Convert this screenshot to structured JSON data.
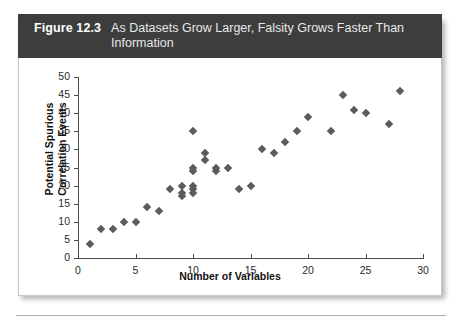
{
  "figure": {
    "label": "Figure 12.3",
    "caption": "As Datasets Grow Larger, Falsity Grows Faster Than Information"
  },
  "chart_data": {
    "type": "scatter",
    "title": "As Datasets Grow Larger, Falsity Grows Faster Than Information",
    "xlabel": "Number of Variables",
    "ylabel": "Potential Spurious Correlation Events",
    "xlim": [
      0,
      30
    ],
    "ylim": [
      0,
      50
    ],
    "xticks": [
      0,
      5,
      10,
      15,
      20,
      25,
      30
    ],
    "yticks": [
      0,
      5,
      10,
      15,
      20,
      25,
      30,
      35,
      40,
      45,
      50
    ],
    "grid": false,
    "legend": null,
    "marker": "diamond",
    "marker_color": "#5b5b5b",
    "points": [
      {
        "x": 1,
        "y": 4
      },
      {
        "x": 2,
        "y": 8
      },
      {
        "x": 3,
        "y": 8
      },
      {
        "x": 4,
        "y": 10
      },
      {
        "x": 5,
        "y": 10
      },
      {
        "x": 6,
        "y": 14
      },
      {
        "x": 7,
        "y": 13
      },
      {
        "x": 8,
        "y": 19
      },
      {
        "x": 9,
        "y": 20
      },
      {
        "x": 9,
        "y": 18
      },
      {
        "x": 9,
        "y": 17
      },
      {
        "x": 10,
        "y": 35
      },
      {
        "x": 10,
        "y": 25
      },
      {
        "x": 10,
        "y": 24
      },
      {
        "x": 10,
        "y": 20
      },
      {
        "x": 10,
        "y": 19
      },
      {
        "x": 10,
        "y": 18
      },
      {
        "x": 11,
        "y": 29
      },
      {
        "x": 11,
        "y": 27
      },
      {
        "x": 12,
        "y": 25
      },
      {
        "x": 12,
        "y": 24
      },
      {
        "x": 13,
        "y": 25
      },
      {
        "x": 14,
        "y": 19
      },
      {
        "x": 15,
        "y": 20
      },
      {
        "x": 16,
        "y": 30
      },
      {
        "x": 17,
        "y": 29
      },
      {
        "x": 18,
        "y": 32
      },
      {
        "x": 19,
        "y": 35
      },
      {
        "x": 20,
        "y": 39
      },
      {
        "x": 22,
        "y": 35
      },
      {
        "x": 23,
        "y": 45
      },
      {
        "x": 24,
        "y": 41
      },
      {
        "x": 25,
        "y": 40
      },
      {
        "x": 27,
        "y": 37
      },
      {
        "x": 28,
        "y": 46
      }
    ]
  }
}
